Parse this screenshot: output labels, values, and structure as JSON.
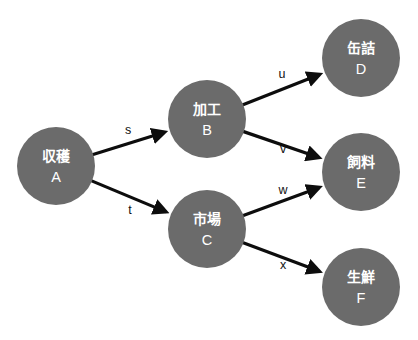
{
  "diagram": {
    "type": "directed-graph",
    "title": "",
    "background_color": "#ffffff",
    "node_fill_color": "#6b6b6b",
    "node_text_color": "#ffffff",
    "edge_color": "#0d0d0d",
    "edge_label_color": "#111111",
    "node_radius": 39,
    "nodes": [
      {
        "id": "A",
        "name_jp": "収穫",
        "label_id": "A",
        "cx": 56,
        "cy": 166
      },
      {
        "id": "B",
        "name_jp": "加工",
        "label_id": "B",
        "cx": 207,
        "cy": 119
      },
      {
        "id": "C",
        "name_jp": "市場",
        "label_id": "C",
        "cx": 207,
        "cy": 229
      },
      {
        "id": "D",
        "name_jp": "缶詰",
        "label_id": "D",
        "cx": 361,
        "cy": 58
      },
      {
        "id": "E",
        "name_jp": "飼料",
        "label_id": "E",
        "cx": 361,
        "cy": 172
      },
      {
        "id": "F",
        "name_jp": "生鮮",
        "label_id": "F",
        "cx": 361,
        "cy": 287
      }
    ],
    "edges": [
      {
        "from": "A",
        "to": "B",
        "label": "s",
        "label_x": 128,
        "label_y": 131
      },
      {
        "from": "A",
        "to": "C",
        "label": "t",
        "label_x": 130,
        "label_y": 211
      },
      {
        "from": "B",
        "to": "D",
        "label": "u",
        "label_x": 282,
        "label_y": 75
      },
      {
        "from": "B",
        "to": "E",
        "label": "v",
        "label_x": 283,
        "label_y": 150
      },
      {
        "from": "C",
        "to": "E",
        "label": "w",
        "label_x": 283,
        "label_y": 191
      },
      {
        "from": "C",
        "to": "F",
        "label": "x",
        "label_x": 283,
        "label_y": 266
      }
    ]
  }
}
